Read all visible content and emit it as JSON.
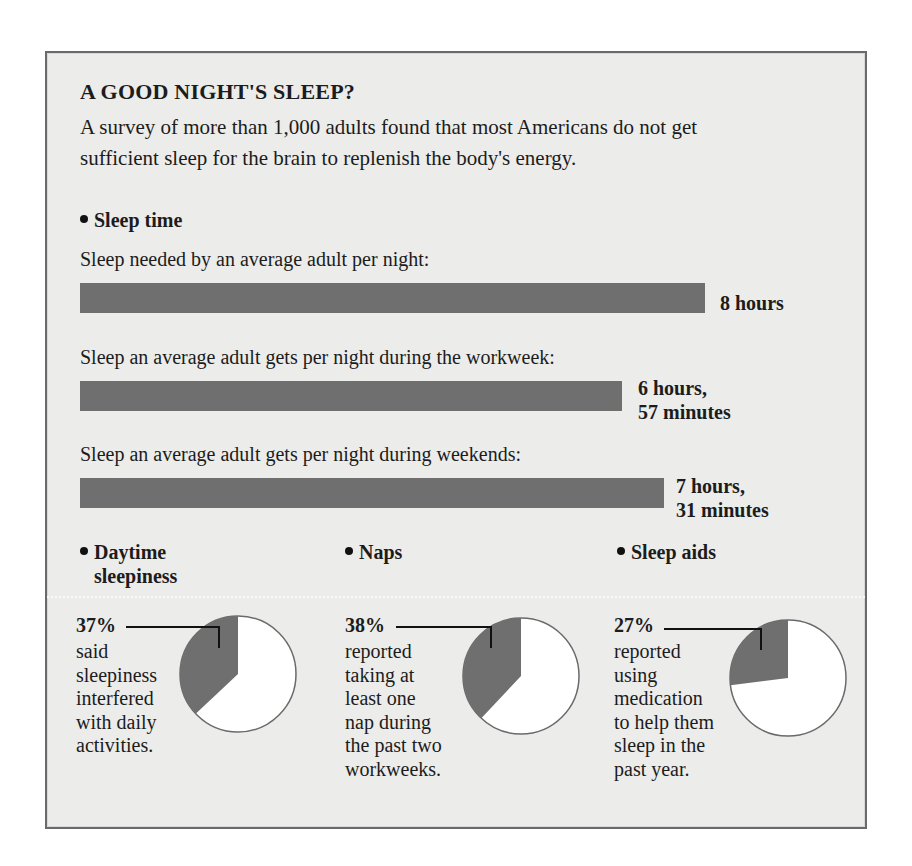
{
  "title": "A GOOD NIGHT'S SLEEP?",
  "intro": {
    "line1": "A survey of more than 1,000 adults found that most Americans do not get",
    "line2": "sufficient sleep for the brain to replenish the body's energy."
  },
  "sleep_time": {
    "heading": "Sleep time",
    "bars": [
      {
        "label": "Sleep needed by an average adult per night:",
        "value_line1": "8 hours",
        "value_line2": "",
        "minutes": 480
      },
      {
        "label": "Sleep an average adult gets per night during the workweek:",
        "value_line1": "6 hours,",
        "value_line2": "57 minutes",
        "minutes": 417
      },
      {
        "label": "Sleep an average adult gets per night during weekends:",
        "value_line1": "7 hours,",
        "value_line2": "31 minutes",
        "minutes": 451
      }
    ]
  },
  "pies": [
    {
      "heading_line1": "Daytime",
      "heading_line2": "sleepiness",
      "percent_label": "37%",
      "percent": 37,
      "desc": [
        "said",
        "sleepiness",
        "interfered",
        "with daily",
        "activities."
      ]
    },
    {
      "heading_line1": "Naps",
      "heading_line2": "",
      "percent_label": "38%",
      "percent": 38,
      "desc": [
        "reported",
        "taking at",
        "least one",
        "nap during",
        "the past two",
        "workweeks."
      ]
    },
    {
      "heading_line1": "Sleep aids",
      "heading_line2": "",
      "percent_label": "27%",
      "percent": 27,
      "desc": [
        "reported",
        "using",
        "medication",
        "to help them",
        "sleep in the",
        "past year."
      ]
    }
  ],
  "colors": {
    "background": "#ececea",
    "bar": "#6f6f6f",
    "pie_slice": "#6f6f6f",
    "pie_rest": "#ffffff",
    "frame": "#6a6a6a"
  },
  "chart_data": [
    {
      "type": "bar",
      "orientation": "horizontal",
      "title": "Sleep time",
      "categories": [
        "Sleep needed by an average adult per night",
        "Sleep an average adult gets per night during the workweek",
        "Sleep an average adult gets per night during weekends"
      ],
      "values": [
        480,
        417,
        451
      ],
      "value_labels": [
        "8 hours",
        "6 hours, 57 minutes",
        "7 hours, 31 minutes"
      ],
      "unit": "minutes",
      "xlabel": "",
      "ylabel": "",
      "grid": false
    },
    {
      "type": "pie",
      "title": "Daytime sleepiness",
      "labels": [
        "Said sleepiness interfered with daily activities",
        "Other"
      ],
      "values": [
        37,
        63
      ]
    },
    {
      "type": "pie",
      "title": "Naps",
      "labels": [
        "Reported taking at least one nap during the past two workweeks",
        "Other"
      ],
      "values": [
        38,
        62
      ]
    },
    {
      "type": "pie",
      "title": "Sleep aids",
      "labels": [
        "Reported using medication to help them sleep in the past year",
        "Other"
      ],
      "values": [
        27,
        73
      ]
    }
  ]
}
